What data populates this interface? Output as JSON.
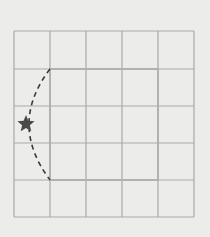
{
  "diagram": {
    "background": "#ececeb",
    "grid": {
      "rows": 5,
      "cols": 5,
      "x_lines": [
        14,
        50,
        86,
        122,
        158,
        194
      ],
      "y_lines": [
        31,
        69,
        106,
        143,
        180,
        217
      ],
      "line_color": "#a9a9a9",
      "line_width": 1.2
    },
    "highlighted_square": {
      "x": 50,
      "y": 69,
      "width": 108,
      "height": 111,
      "color": "#b3b1ae",
      "line_width": 2,
      "description": "3x3 square within the 5x5 grid"
    },
    "rotation_arc": {
      "start": [
        50,
        69
      ],
      "end": [
        50,
        180
      ],
      "control": [
        8,
        124
      ],
      "style": "dashed",
      "color": "#3a3a3a",
      "dash": "5,4"
    },
    "star_marker": {
      "center": [
        26,
        124
      ],
      "size": 9,
      "color": "#4a4a4a",
      "icon": "star-icon"
    }
  }
}
